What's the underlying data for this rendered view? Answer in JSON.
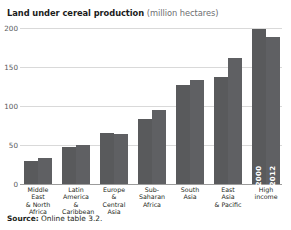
{
  "figure": {
    "title_main": "Land under cereal production",
    "title_sub": "(million hectares)",
    "source_label": "Source:",
    "source_text": " Online table 3.2."
  },
  "chart_data": {
    "type": "bar",
    "title": "Land under cereal production (million hectares)",
    "xlabel": "",
    "ylabel": "",
    "ylim": [
      0,
      200
    ],
    "yticks": [
      0,
      50,
      100,
      150,
      200
    ],
    "grid": true,
    "legend": "in-bar labels on last group",
    "bar_color": "#595a5c",
    "categories": [
      "Middle East & North Africa",
      "Latin America & Caribbean",
      "Europe & Central Asia",
      "Sub-Saharan Africa",
      "South Asia",
      "East Asia & Pacific",
      "High income"
    ],
    "category_lines": [
      [
        "Middle East",
        "& North",
        "Africa"
      ],
      [
        "Latin",
        "America &",
        "Caribbean"
      ],
      [
        "Europe",
        "& Central",
        "Asia"
      ],
      [
        "Sub-Saharan",
        "Africa"
      ],
      [
        "South",
        "Asia"
      ],
      [
        "East Asia",
        "& Pacific"
      ],
      [
        "High",
        "income"
      ]
    ],
    "series": [
      {
        "name": "2000",
        "values": [
          30,
          47,
          66,
          83,
          127,
          137,
          199
        ]
      },
      {
        "name": "2012",
        "values": [
          33,
          50,
          64,
          95,
          133,
          162,
          188
        ]
      }
    ]
  }
}
